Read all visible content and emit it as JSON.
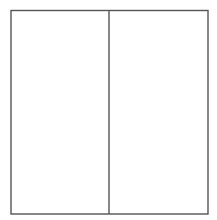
{
  "diagram": {
    "type": "rectangle-divided",
    "stroke_color": "#555555",
    "background_color": "#ffffff",
    "stroke_width": 1.4,
    "outer_rect": {
      "x": 11,
      "y": 10.5,
      "width": 197,
      "height": 203.5
    },
    "divider_x": 109,
    "parts": [
      {
        "name": "left-half",
        "shaded": false
      },
      {
        "name": "right-half",
        "shaded": false
      }
    ]
  }
}
